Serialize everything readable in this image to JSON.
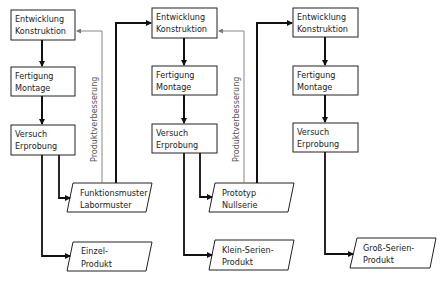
{
  "diagram": {
    "stages": [
      {
        "process": [
          {
            "line1": "Entwicklung",
            "line2": "Konstruktion"
          },
          {
            "line1": "Fertigung",
            "line2": "Montage"
          },
          {
            "line1": "Versuch",
            "line2": "Erprobung"
          }
        ],
        "intermediate": {
          "line1": "Funktionsmuster",
          "line2": "Labormuster"
        },
        "product": {
          "line1": "Einzel-",
          "line2": "Produkt"
        },
        "feedback_label": "Produktverbesserung"
      },
      {
        "process": [
          {
            "line1": "Entwicklung",
            "line2": "Konstruktion"
          },
          {
            "line1": "Fertigung",
            "line2": "Montage"
          },
          {
            "line1": "Versuch",
            "line2": "Erprobung"
          }
        ],
        "intermediate": {
          "line1": "Prototyp",
          "line2": "Nullserie"
        },
        "product": {
          "line1": "Klein-Serien-",
          "line2": "Produkt"
        },
        "feedback_label": "Produktverbesserung"
      },
      {
        "process": [
          {
            "line1": "Entwicklung",
            "line2": "Konstruktion"
          },
          {
            "line1": "Fertigung",
            "line2": "Montage"
          },
          {
            "line1": "Versuch",
            "line2": "Erprobung"
          }
        ],
        "product": {
          "line1": "Groß-Serien-",
          "line2": "Produkt"
        }
      }
    ]
  }
}
